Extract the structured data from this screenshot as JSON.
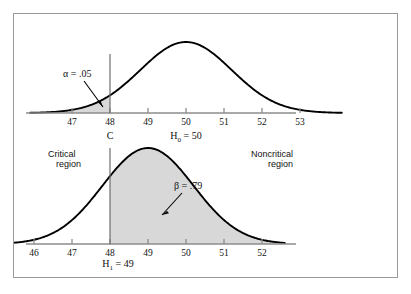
{
  "figure": {
    "kind": "statistical-hypothesis-test-figure",
    "frame_color": "#9a9a9a",
    "shade_color": "#d8d8d8",
    "curve_color": "#000000",
    "axis_color": "#8d8d8d"
  },
  "labels": {
    "alpha": "α = .05",
    "beta": "β = .79",
    "critical_region_line1": "Critical",
    "critical_region_line2": "region",
    "noncritical_region_line1": "Noncritical",
    "noncritical_region_line2": "region",
    "critical_value": "C",
    "h0_prefix": "H",
    "h0_sub": "0",
    "h0_suffix": " = 50",
    "h1_prefix": "H",
    "h1_sub": "1",
    "h1_suffix": " = 49"
  },
  "chart_data": {
    "type": "area",
    "title": "",
    "panels": [
      {
        "name": "null-distribution",
        "label": "H0 = 50",
        "mean": 50,
        "sd": 1.2,
        "xlabel": "",
        "ylabel": "",
        "xlim": [
          45.9,
          54.1
        ],
        "ticks": [
          47,
          48,
          49,
          50,
          51,
          52,
          53
        ],
        "tick_labels": [
          "47",
          "48",
          "49",
          "50",
          "51",
          "52",
          "53"
        ],
        "critical_value": 48,
        "shaded_region": {
          "name": "alpha",
          "from": 45.9,
          "to": 48,
          "area": 0.05,
          "label": "α = .05"
        },
        "grid": false
      },
      {
        "name": "alternative-distribution",
        "label": "H1 = 49",
        "mean": 49,
        "sd": 1.2,
        "xlabel": "",
        "ylabel": "",
        "xlim": [
          45.3,
          52.6
        ],
        "ticks": [
          46,
          47,
          48,
          49,
          50,
          51,
          52
        ],
        "tick_labels": [
          "46",
          "47",
          "48",
          "49",
          "50",
          "51",
          "52"
        ],
        "critical_value": 48,
        "shaded_region": {
          "name": "beta",
          "from": 48,
          "to": 52.6,
          "area": 0.79,
          "label": "β = .79"
        },
        "grid": false
      }
    ],
    "legend": [],
    "annotations": [
      {
        "text": "α = .05",
        "panel": "null-distribution",
        "points_to": 47.75
      },
      {
        "text": "β = .79",
        "panel": "alternative-distribution",
        "points_to": 49.7
      },
      {
        "text": "Critical region",
        "position": "left-middle"
      },
      {
        "text": "Noncritical region",
        "position": "right-middle"
      },
      {
        "text": "C",
        "panel": "null-distribution",
        "at": 48
      }
    ]
  }
}
